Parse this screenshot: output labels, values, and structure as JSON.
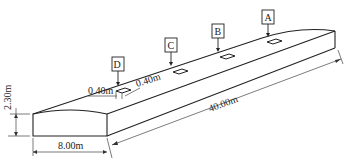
{
  "diagram": {
    "type": "isometric slab drawing",
    "markers": [
      {
        "id": "A",
        "label": "A"
      },
      {
        "id": "B",
        "label": "B"
      },
      {
        "id": "C",
        "label": "C"
      },
      {
        "id": "D",
        "label": "D"
      }
    ],
    "dimensions": {
      "height": "2.30m",
      "width": "8.00m",
      "length": "40.00m",
      "opening_x": "0.40m",
      "opening_y": "0.40m"
    },
    "colors": {
      "line": "#222222",
      "background": "#ffffff"
    }
  }
}
